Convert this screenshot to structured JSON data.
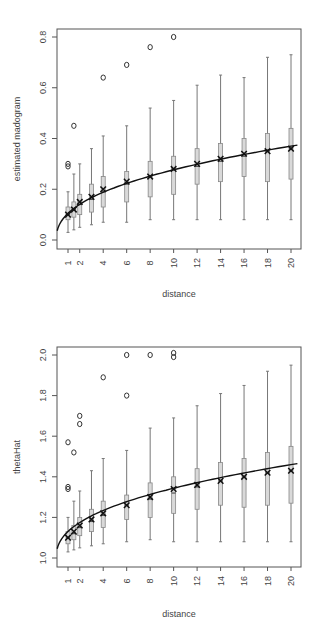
{
  "chart_data": [
    {
      "type": "box",
      "title": "",
      "xlabel": "distance",
      "ylabel": "estimated madogram",
      "ylim": [
        -0.03,
        0.84
      ],
      "yticks": [
        0.0,
        0.2,
        0.4,
        0.6,
        0.8
      ],
      "ytick_labels": [
        "0.0",
        "0.2",
        "0.4",
        "0.6",
        "0.8"
      ],
      "xtick_labels": [
        "1",
        "2",
        "4",
        "6",
        "8",
        "10",
        "12",
        "14",
        "16",
        "18",
        "20"
      ],
      "x": [
        1,
        1.5,
        2,
        3,
        4,
        6,
        8,
        10,
        12,
        14,
        16,
        18,
        20
      ],
      "boxes": [
        {
          "x": 1,
          "lo": 0.03,
          "q1": 0.08,
          "med": 0.1,
          "q3": 0.13,
          "hi": 0.19,
          "mark": 0.1
        },
        {
          "x": 1.5,
          "lo": 0.04,
          "q1": 0.09,
          "med": 0.12,
          "q3": 0.15,
          "hi": 0.26,
          "mark": 0.12
        },
        {
          "x": 2,
          "lo": 0.05,
          "q1": 0.1,
          "med": 0.14,
          "q3": 0.18,
          "hi": 0.3,
          "mark": 0.15
        },
        {
          "x": 3,
          "lo": 0.06,
          "q1": 0.11,
          "med": 0.16,
          "q3": 0.22,
          "hi": 0.36,
          "mark": 0.17
        },
        {
          "x": 4,
          "lo": 0.07,
          "q1": 0.13,
          "med": 0.19,
          "q3": 0.25,
          "hi": 0.41,
          "mark": 0.2
        },
        {
          "x": 6,
          "lo": 0.07,
          "q1": 0.15,
          "med": 0.22,
          "q3": 0.27,
          "hi": 0.45,
          "mark": 0.23
        },
        {
          "x": 8,
          "lo": 0.08,
          "q1": 0.17,
          "med": 0.25,
          "q3": 0.31,
          "hi": 0.52,
          "mark": 0.25
        },
        {
          "x": 10,
          "lo": 0.08,
          "q1": 0.18,
          "med": 0.28,
          "q3": 0.33,
          "hi": 0.55,
          "mark": 0.28
        },
        {
          "x": 12,
          "lo": 0.08,
          "q1": 0.22,
          "med": 0.29,
          "q3": 0.36,
          "hi": 0.61,
          "mark": 0.3
        },
        {
          "x": 14,
          "lo": 0.08,
          "q1": 0.23,
          "med": 0.31,
          "q3": 0.38,
          "hi": 0.65,
          "mark": 0.32
        },
        {
          "x": 16,
          "lo": 0.08,
          "q1": 0.25,
          "med": 0.33,
          "q3": 0.4,
          "hi": 0.64,
          "mark": 0.34
        },
        {
          "x": 18,
          "lo": 0.08,
          "q1": 0.23,
          "med": 0.35,
          "q3": 0.42,
          "hi": 0.72,
          "mark": 0.35
        },
        {
          "x": 20,
          "lo": 0.08,
          "q1": 0.24,
          "med": 0.36,
          "q3": 0.44,
          "hi": 0.73,
          "mark": 0.36
        }
      ],
      "outliers": [
        {
          "x": 1,
          "y": 0.29
        },
        {
          "x": 1,
          "y": 0.3
        },
        {
          "x": 1.5,
          "y": 0.45
        },
        {
          "x": 4,
          "y": 0.64
        },
        {
          "x": 6,
          "y": 0.69
        },
        {
          "x": 8,
          "y": 0.76
        },
        {
          "x": 10,
          "y": 0.8
        }
      ],
      "curve": {
        "type": "fitted",
        "y_at_0": 0.0,
        "y_at_20": 0.37
      }
    },
    {
      "type": "box",
      "title": "",
      "xlabel": "distance",
      "ylabel": "thetaHat",
      "ylim": [
        0.96,
        2.04
      ],
      "yticks": [
        1.0,
        1.2,
        1.4,
        1.6,
        1.8,
        2.0
      ],
      "ytick_labels": [
        "1.0",
        "1.2",
        "1.4",
        "1.6",
        "1.8",
        "2.0"
      ],
      "xtick_labels": [
        "1",
        "2",
        "4",
        "6",
        "8",
        "10",
        "12",
        "14",
        "16",
        "18",
        "20"
      ],
      "x": [
        1,
        1.5,
        2,
        3,
        4,
        6,
        8,
        10,
        12,
        14,
        16,
        18,
        20
      ],
      "boxes": [
        {
          "x": 1,
          "lo": 1.03,
          "q1": 1.07,
          "med": 1.1,
          "q3": 1.13,
          "hi": 1.2,
          "mark": 1.1
        },
        {
          "x": 1.5,
          "lo": 1.04,
          "q1": 1.09,
          "med": 1.12,
          "q3": 1.16,
          "hi": 1.28,
          "mark": 1.13
        },
        {
          "x": 2,
          "lo": 1.05,
          "q1": 1.11,
          "med": 1.15,
          "q3": 1.2,
          "hi": 1.33,
          "mark": 1.16
        },
        {
          "x": 3,
          "lo": 1.06,
          "q1": 1.13,
          "med": 1.18,
          "q3": 1.24,
          "hi": 1.43,
          "mark": 1.19
        },
        {
          "x": 4,
          "lo": 1.07,
          "q1": 1.15,
          "med": 1.21,
          "q3": 1.28,
          "hi": 1.49,
          "mark": 1.22
        },
        {
          "x": 6,
          "lo": 1.08,
          "q1": 1.19,
          "med": 1.26,
          "q3": 1.31,
          "hi": 1.53,
          "mark": 1.26
        },
        {
          "x": 8,
          "lo": 1.09,
          "q1": 1.2,
          "med": 1.29,
          "q3": 1.37,
          "hi": 1.64,
          "mark": 1.3
        },
        {
          "x": 10,
          "lo": 1.08,
          "q1": 1.22,
          "med": 1.32,
          "q3": 1.4,
          "hi": 1.69,
          "mark": 1.34
        },
        {
          "x": 12,
          "lo": 1.08,
          "q1": 1.24,
          "med": 1.35,
          "q3": 1.44,
          "hi": 1.75,
          "mark": 1.36
        },
        {
          "x": 14,
          "lo": 1.08,
          "q1": 1.26,
          "med": 1.38,
          "q3": 1.47,
          "hi": 1.81,
          "mark": 1.38
        },
        {
          "x": 16,
          "lo": 1.08,
          "q1": 1.25,
          "med": 1.4,
          "q3": 1.49,
          "hi": 1.85,
          "mark": 1.4
        },
        {
          "x": 18,
          "lo": 1.08,
          "q1": 1.26,
          "med": 1.42,
          "q3": 1.52,
          "hi": 1.92,
          "mark": 1.42
        },
        {
          "x": 20,
          "lo": 1.08,
          "q1": 1.27,
          "med": 1.43,
          "q3": 1.55,
          "hi": 1.95,
          "mark": 1.43
        }
      ],
      "outliers": [
        {
          "x": 1,
          "y": 1.34
        },
        {
          "x": 1,
          "y": 1.35
        },
        {
          "x": 1,
          "y": 1.57
        },
        {
          "x": 1.5,
          "y": 1.52
        },
        {
          "x": 2,
          "y": 1.66
        },
        {
          "x": 2,
          "y": 1.7
        },
        {
          "x": 4,
          "y": 1.89
        },
        {
          "x": 6,
          "y": 1.8
        },
        {
          "x": 6,
          "y": 2.0
        },
        {
          "x": 8,
          "y": 2.0
        },
        {
          "x": 10,
          "y": 1.99
        },
        {
          "x": 10,
          "y": 2.01
        }
      ],
      "curve": {
        "type": "fitted",
        "y_at_0": 1.0,
        "y_at_20": 1.46
      }
    }
  ]
}
